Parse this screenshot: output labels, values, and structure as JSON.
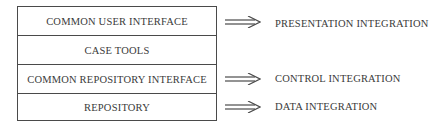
{
  "diagram": {
    "layers": [
      {
        "label": "COMMON USER INTERFACE"
      },
      {
        "label": "CASE TOOLS"
      },
      {
        "label": "COMMON REPOSITORY INTERFACE"
      },
      {
        "label": "REPOSITORY"
      }
    ],
    "integrations": [
      {
        "arrow": "double-arrow-right",
        "label": "PRESENTATION INTEGRATION",
        "layer": "COMMON USER INTERFACE"
      },
      {
        "arrow": "double-arrow-right",
        "label": "CONTROL INTEGRATION",
        "layer": "COMMON REPOSITORY INTERFACE"
      },
      {
        "arrow": "double-arrow-right",
        "label": "DATA INTEGRATION",
        "layer": "REPOSITORY"
      }
    ]
  }
}
